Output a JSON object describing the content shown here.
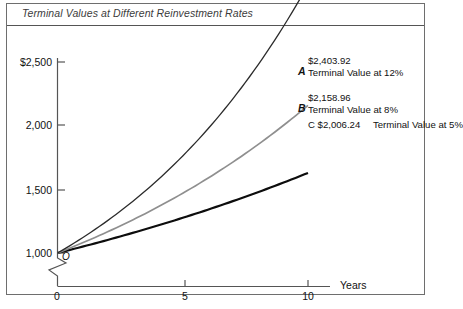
{
  "figure": {
    "title": "Terminal Values at Different Reinvestment Rates"
  },
  "chart_data": {
    "type": "line",
    "title": "Terminal Values at Different Reinvestment Rates",
    "xlabel": "Years",
    "ylabel": "",
    "xlim": [
      0,
      10
    ],
    "ylim": [
      1000,
      2500
    ],
    "grid": false,
    "legend_position": "right-inline-labels",
    "axis_break": true,
    "axis_break_note": "y-axis broken below 1,000",
    "xticks": [
      "0",
      "5",
      "10"
    ],
    "xtick_values": [
      0,
      5,
      10
    ],
    "yticks": [
      "1,000",
      "1,500",
      "2,000",
      "$2,500"
    ],
    "ytick_values": [
      1000,
      1500,
      2000,
      2500
    ],
    "origin_label": "O",
    "x": [
      0,
      1,
      2,
      3,
      4,
      5,
      6,
      7,
      8,
      9,
      10
    ],
    "series": [
      {
        "name": "A",
        "label": "Terminal Value at 12%",
        "rate_percent": 12,
        "terminal_value": "$2,403.92",
        "terminal_value_number": 2403.92,
        "color": "#2b2b2b",
        "values": [
          1000,
          1096,
          1201,
          1322,
          1458,
          1611,
          1780,
          1968,
          2176,
          2404,
          2403.92
        ]
      },
      {
        "name": "B",
        "label": "Terminal Value at 8%",
        "rate_percent": 8,
        "terminal_value": "$2,158.96",
        "terminal_value_number": 2158.96,
        "color": "#8f8f8f",
        "values": [
          1000,
          1080,
          1166,
          1260,
          1360,
          1469,
          1587,
          1714,
          1851,
          1999,
          2158.96
        ]
      },
      {
        "name": "C",
        "label": "Terminal Value at 5%",
        "rate_percent": 5,
        "terminal_value": "$2,006.24",
        "terminal_value_number": 2006.24,
        "color": "#0d0d0d",
        "values": [
          1000,
          1063,
          1130,
          1201,
          1277,
          1357,
          1443,
          1534,
          1630,
          1733,
          2006.24
        ]
      }
    ],
    "annotations": [
      {
        "marker": "A",
        "value": "$2,403.92",
        "text": "Terminal Value at 12%"
      },
      {
        "marker": "B",
        "value": "$2,158.96",
        "text": "Terminal Value at 8%"
      },
      {
        "marker": "C",
        "value": "$2,006.24",
        "text": "Terminal Value at 5%"
      }
    ]
  }
}
